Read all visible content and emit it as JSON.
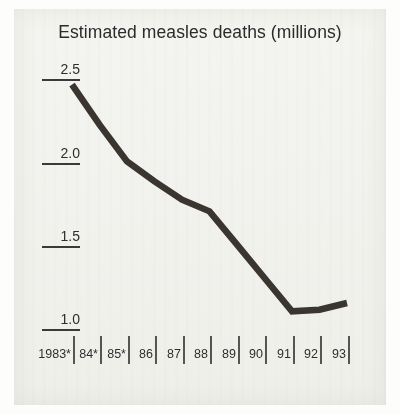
{
  "chart_data": {
    "type": "line",
    "title": "Estimated measles deaths (millions)",
    "xlabel": "",
    "ylabel": "",
    "categories": [
      "1983*",
      "84*",
      "85*",
      "86",
      "87",
      "88",
      "89",
      "90",
      "91",
      "92",
      "93"
    ],
    "values": [
      2.46,
      2.22,
      2.0,
      1.88,
      1.77,
      1.7,
      1.5,
      1.3,
      1.1,
      1.11,
      1.15
    ],
    "series": [
      {
        "name": "Estimated measles deaths (millions)",
        "values": [
          2.46,
          2.22,
          2.0,
          1.88,
          1.77,
          1.7,
          1.5,
          1.3,
          1.1,
          1.11,
          1.15
        ]
      }
    ],
    "ylim": [
      1.0,
      2.5
    ],
    "yticks": [
      "2.5",
      "2.0",
      "1.5",
      "1.0"
    ],
    "ytick_values": [
      2.5,
      2.0,
      1.5,
      1.0
    ],
    "xlim": [
      "1983*",
      "93"
    ],
    "grid": false,
    "legend": "none",
    "line_color": "#3a352f",
    "background_color": "#f1f1ed",
    "text_color": "#2b2b2b",
    "footnote_marker": "*"
  },
  "axes": {
    "y": {
      "ticks": [
        {
          "label": "2.5",
          "value": 2.5
        },
        {
          "label": "2.0",
          "value": 2.0
        },
        {
          "label": "1.5",
          "value": 1.5
        },
        {
          "label": "1.0",
          "value": 1.0
        }
      ]
    },
    "x": {
      "ticks": [
        {
          "label": "1983*"
        },
        {
          "label": "84*"
        },
        {
          "label": "85*"
        },
        {
          "label": "86"
        },
        {
          "label": "87"
        },
        {
          "label": "88"
        },
        {
          "label": "89"
        },
        {
          "label": "90"
        },
        {
          "label": "91"
        },
        {
          "label": "92"
        },
        {
          "label": "93"
        }
      ]
    }
  }
}
